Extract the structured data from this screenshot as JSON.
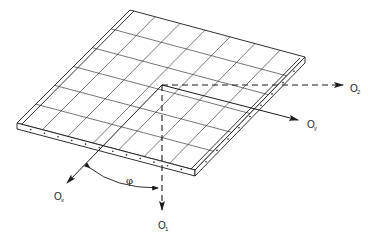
{
  "diagram": {
    "type": "isometric-plate-axes",
    "grid": {
      "columns": 7,
      "rows": 6
    },
    "colors": {
      "line": "#1a1a1a",
      "background": "#ffffff"
    },
    "axes": [
      {
        "id": "o2",
        "base": "O",
        "subscript": "2",
        "style": "dashed",
        "direction": "horizontal-right"
      },
      {
        "id": "oy",
        "base": "O",
        "subscript": "y",
        "style": "solid",
        "direction": "along-plate-right"
      },
      {
        "id": "o1",
        "base": "O",
        "subscript": "1",
        "style": "dashed",
        "direction": "vertical-down"
      },
      {
        "id": "ox",
        "base": "O",
        "subscript": "x",
        "style": "solid",
        "direction": "along-plate-left"
      }
    ],
    "angle_label": "φ"
  }
}
